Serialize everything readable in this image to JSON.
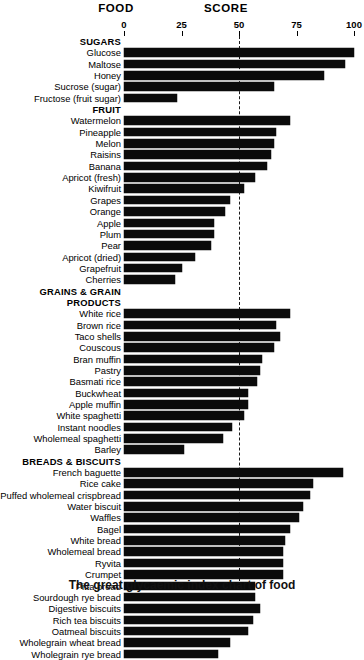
{
  "header": {
    "food_label": "FOOD",
    "score_label": "SCORE"
  },
  "caption": "The great glycaemic index chart of food",
  "chart_data": {
    "type": "bar",
    "title": "FOOD SCORE",
    "xlabel": "SCORE",
    "ylabel": "FOOD",
    "orientation": "horizontal",
    "xlim": [
      0,
      100
    ],
    "xticks": [
      0,
      25,
      50,
      75,
      100
    ],
    "xtick_labels": [
      "0",
      "25",
      "50",
      "75",
      "100"
    ],
    "grid": false,
    "reference_line": 50,
    "bar_color": "#0b0b0b",
    "legend": null,
    "groups": [
      {
        "name": "SUGARS",
        "heading_lines": [
          "SUGARS"
        ],
        "items": [
          {
            "label": "Glucose",
            "value": 100
          },
          {
            "label": "Maltose",
            "value": 96
          },
          {
            "label": "Honey",
            "value": 87
          },
          {
            "label": "Sucrose (sugar)",
            "value": 65
          },
          {
            "label": "Fructose (fruit sugar)",
            "value": 23
          }
        ]
      },
      {
        "name": "FRUIT",
        "heading_lines": [
          "FRUIT"
        ],
        "items": [
          {
            "label": "Watermelon",
            "value": 72
          },
          {
            "label": "Pineapple",
            "value": 66
          },
          {
            "label": "Melon",
            "value": 65
          },
          {
            "label": "Raisins",
            "value": 64
          },
          {
            "label": "Banana",
            "value": 62
          },
          {
            "label": "Apricot (fresh)",
            "value": 57
          },
          {
            "label": "Kiwifruit",
            "value": 52
          },
          {
            "label": "Grapes",
            "value": 46
          },
          {
            "label": "Orange",
            "value": 44
          },
          {
            "label": "Apple",
            "value": 39
          },
          {
            "label": "Plum",
            "value": 39
          },
          {
            "label": "Pear",
            "value": 38
          },
          {
            "label": "Apricot (dried)",
            "value": 31
          },
          {
            "label": "Grapefruit",
            "value": 25
          },
          {
            "label": "Cherries",
            "value": 22
          }
        ]
      },
      {
        "name": "GRAINS & GRAIN PRODUCTS",
        "heading_lines": [
          "GRAINS & GRAIN",
          "PRODUCTS"
        ],
        "items": [
          {
            "label": "White rice",
            "value": 72
          },
          {
            "label": "Brown rice",
            "value": 66
          },
          {
            "label": "Taco shells",
            "value": 68
          },
          {
            "label": "Couscous",
            "value": 65
          },
          {
            "label": "Bran muffin",
            "value": 60
          },
          {
            "label": "Pastry",
            "value": 59
          },
          {
            "label": "Basmati rice",
            "value": 58
          },
          {
            "label": "Buckwheat",
            "value": 54
          },
          {
            "label": "Apple muffin",
            "value": 54
          },
          {
            "label": "White spaghetti",
            "value": 52
          },
          {
            "label": "Instant noodles",
            "value": 47
          },
          {
            "label": "Wholemeal spaghetti",
            "value": 43
          },
          {
            "label": "Barley",
            "value": 26
          }
        ]
      },
      {
        "name": "BREADS & BISCUITS",
        "heading_lines": [
          "BREADS & BISCUITS"
        ],
        "items": [
          {
            "label": "French baguette",
            "value": 95
          },
          {
            "label": "Rice cake",
            "value": 82
          },
          {
            "label": "Puffed wholemeal crispbread",
            "value": 81
          },
          {
            "label": "Water biscuit",
            "value": 78
          },
          {
            "label": "Waffles",
            "value": 76
          },
          {
            "label": "Bagel",
            "value": 72
          },
          {
            "label": "White bread",
            "value": 70
          },
          {
            "label": "Wholemeal bread",
            "value": 69
          },
          {
            "label": "Ryvita",
            "value": 69
          },
          {
            "label": "Crumpet",
            "value": 69
          },
          {
            "label": "Pitta bread",
            "value": 57
          },
          {
            "label": "Sourdough rye bread",
            "value": 57
          },
          {
            "label": "Digestive biscuits",
            "value": 59
          },
          {
            "label": "Rich tea biscuits",
            "value": 56
          },
          {
            "label": "Oatmeal biscuits",
            "value": 54
          },
          {
            "label": "Wholegrain wheat bread",
            "value": 46
          },
          {
            "label": "Wholegrain rye bread",
            "value": 41
          }
        ]
      }
    ]
  }
}
